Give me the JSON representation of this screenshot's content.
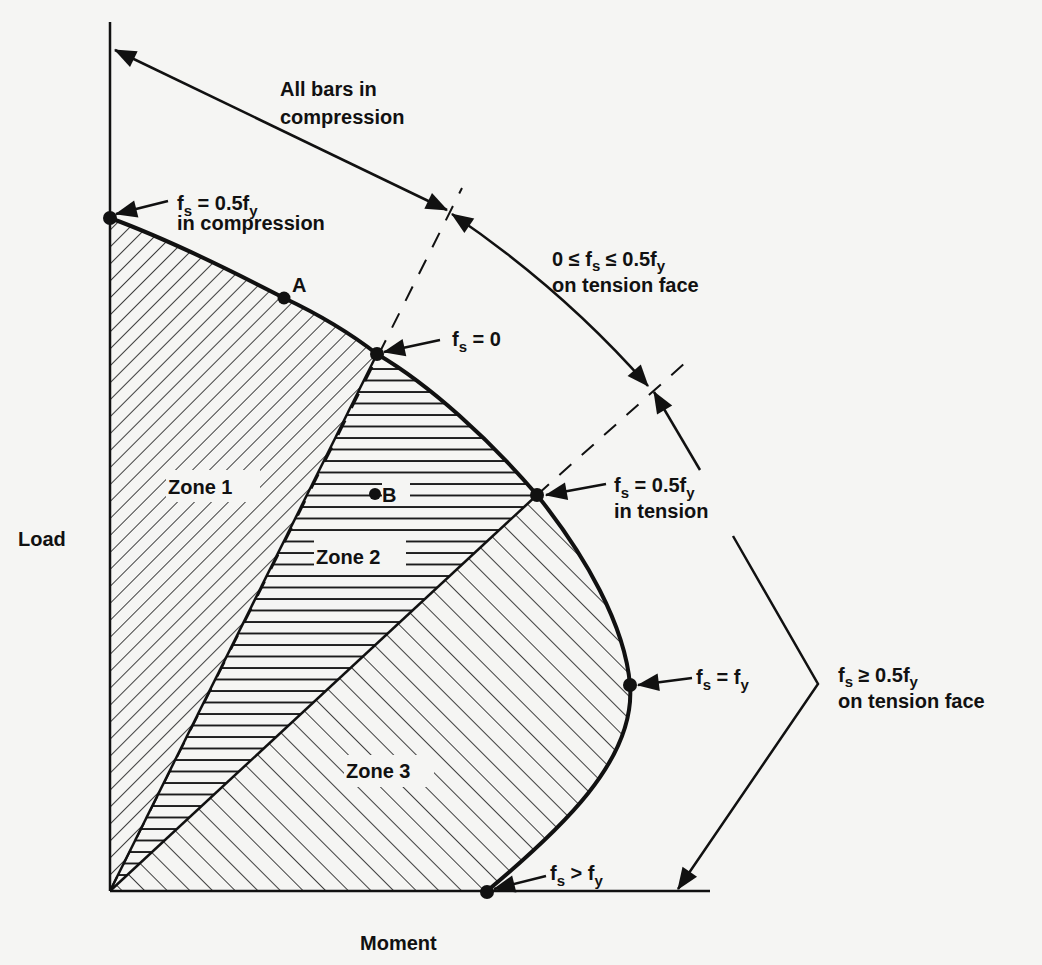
{
  "axes": {
    "y_label": "Load",
    "x_label": "Moment"
  },
  "points": {
    "A": "A",
    "B": "B"
  },
  "zones": {
    "zone1": "Zone 1",
    "zone2": "Zone 2",
    "zone3": "Zone 3"
  },
  "annotations": {
    "compression_point": {
      "line1_main": "f",
      "line1_sub": "s",
      "line1_rest": " = 0.5f",
      "line1_sub2": "y",
      "line2": "in compression"
    },
    "zero_point": {
      "main": "f",
      "sub": "s",
      "rest": " = 0"
    },
    "half_tension_point": {
      "line1_main": "f",
      "line1_sub": "s",
      "line1_rest": " = 0.5f",
      "line1_sub2": "y",
      "line2": "in tension"
    },
    "yield_point": {
      "main": "f",
      "sub": "s",
      "rest": " = f",
      "sub2": "y"
    },
    "beyond_yield_point": {
      "main": "f",
      "sub": "s",
      "rest": " > f",
      "sub2": "y"
    }
  },
  "ranges": {
    "all_compression": {
      "line1": "All bars in",
      "line2": "compression"
    },
    "low_tension": {
      "line1_pre": "0 ≤ f",
      "line1_sub": "s",
      "line1_mid": " ≤ 0.5f",
      "line1_sub2": "y",
      "line2": "on tension face"
    },
    "high_tension": {
      "line1_main": "f",
      "line1_sub": "s",
      "line1_rest": " ≥ 0.5f",
      "line1_sub2": "y",
      "line2": "on tension face"
    }
  },
  "colors": {
    "ink": "#111111",
    "background": "#f5f5f3"
  }
}
